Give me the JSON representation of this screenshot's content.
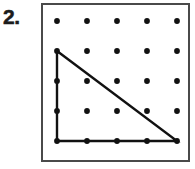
{
  "problem": {
    "number_label": "2.",
    "type": "geoboard"
  },
  "geoboard": {
    "frame": {
      "x": 41,
      "y": 3,
      "width": 149,
      "height": 159,
      "border_color": "#4a4a4a",
      "border_width": 2,
      "background": "#ffffff"
    },
    "grid": {
      "rows": 5,
      "columns": 5,
      "col_x": [
        16,
        46,
        76,
        106,
        136
      ],
      "row_y": [
        18,
        48,
        78,
        108,
        138
      ],
      "spacing": 30,
      "peg_radius": 2.9,
      "peg_color": "#111111"
    },
    "shape": {
      "name": "right-triangle",
      "label": "right triangle",
      "stroke_color": "#111111",
      "stroke_width": 2.4,
      "fill": "none",
      "vertices_grid": [
        {
          "col": 1,
          "row": 2
        },
        {
          "col": 1,
          "row": 5
        },
        {
          "col": 4,
          "row": 5
        }
      ],
      "points": "16,48 16,138 136,138 16,48",
      "legs": {
        "vertical_units": 3,
        "horizontal_units": 3
      }
    }
  }
}
